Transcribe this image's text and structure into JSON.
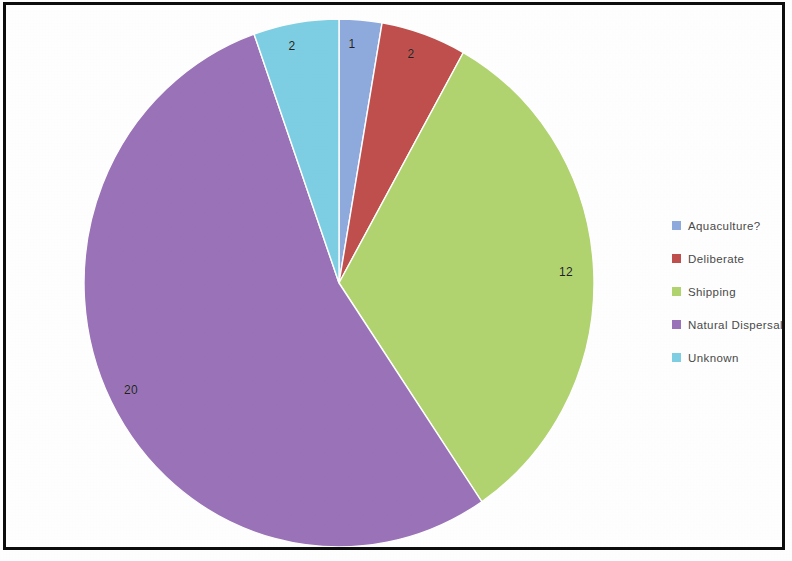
{
  "chart_data": {
    "type": "pie",
    "title": "",
    "subtitle": "",
    "xlabel": "",
    "ylabel": "",
    "grid": false,
    "legend_position": "right",
    "total": 37,
    "start_angle_deg": 0,
    "direction": "clockwise",
    "categories": [
      "Aquaculture?",
      "Deliberate",
      "Shipping",
      "Natural Dispersal",
      "Unknown"
    ],
    "values": [
      1,
      2,
      12,
      20,
      2
    ],
    "data_labels": [
      "1",
      "2",
      "12",
      "20",
      "2"
    ],
    "colors": [
      "#8faadc",
      "#c0504d",
      "#b2d470",
      "#9a73b8",
      "#7ecfe3"
    ],
    "slices": [
      {
        "label": "Aquaculture?",
        "value": 1,
        "data_label": "1",
        "color": "#8faadc",
        "start_deg": 0,
        "end_deg": 9.73,
        "label_x": 352,
        "label_y": 44
      },
      {
        "label": "Deliberate",
        "value": 2,
        "data_label": "2",
        "color": "#c0504d",
        "start_deg": 9.73,
        "end_deg": 29.19,
        "label_x": 411,
        "label_y": 54
      },
      {
        "label": "Shipping",
        "value": 12,
        "data_label": "12",
        "color": "#b2d470",
        "start_deg": 29.19,
        "end_deg": 145.95,
        "label_x": 566,
        "label_y": 272
      },
      {
        "label": "Natural Dispersal",
        "value": 20,
        "data_label": "20",
        "color": "#9a73b8",
        "start_deg": 145.95,
        "end_deg": 340.54,
        "label_x": 131,
        "label_y": 390
      },
      {
        "label": "Unknown",
        "value": 2,
        "data_label": "2",
        "color": "#7ecfe3",
        "start_deg": 340.54,
        "end_deg": 360,
        "label_x": 292,
        "label_y": 46
      }
    ]
  },
  "legend": {
    "items": [
      {
        "label": "Aquaculture?",
        "color": "#8faadc"
      },
      {
        "label": "Deliberate",
        "color": "#c0504d"
      },
      {
        "label": "Shipping",
        "color": "#b2d470"
      },
      {
        "label": "Natural Dispersal",
        "color": "#9a73b8"
      },
      {
        "label": "Unknown",
        "color": "#7ecfe3"
      }
    ]
  },
  "frame": {
    "border_color": "#0d0d0d",
    "background_color": "#ffffff"
  }
}
